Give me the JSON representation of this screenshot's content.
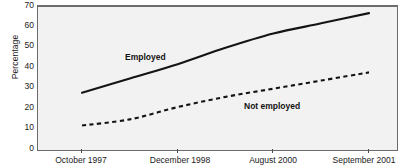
{
  "chart_data": {
    "type": "line",
    "title": "",
    "subtitle": "",
    "xlabel": "",
    "ylabel": "Percentage",
    "xlim": [
      0,
      3
    ],
    "ylim": [
      0,
      70
    ],
    "yticks": [
      0,
      10,
      20,
      30,
      40,
      50,
      60,
      70
    ],
    "grid": false,
    "legend_position": "inline-annotations",
    "categories": [
      "October 1997",
      "December 1998",
      "August 2000",
      "September 2001"
    ],
    "series": [
      {
        "name": "Employed",
        "style": "solid",
        "color": "#141414",
        "values": [
          28,
          42,
          57,
          67
        ],
        "detailed_points": [
          {
            "x": "October 1997",
            "y": 28
          },
          {
            "x": "",
            "y": 35
          },
          {
            "x": "December 1998",
            "y": 42
          },
          {
            "x": "",
            "y": 50
          },
          {
            "x": "August 2000",
            "y": 57
          },
          {
            "x": "",
            "y": 62
          },
          {
            "x": "September 2001",
            "y": 67
          }
        ]
      },
      {
        "name": "Not employed",
        "style": "dashed",
        "color": "#141414",
        "values": [
          12,
          21,
          30,
          38
        ],
        "detailed_points": [
          {
            "x": "October 1997",
            "y": 12
          },
          {
            "x": "",
            "y": 15
          },
          {
            "x": "December 1998",
            "y": 21
          },
          {
            "x": "",
            "y": 26
          },
          {
            "x": "August 2000",
            "y": 30
          },
          {
            "x": "",
            "y": 34
          },
          {
            "x": "September 2001",
            "y": 38
          }
        ]
      }
    ],
    "annotations": [
      {
        "text": "Employed",
        "series": "Employed"
      },
      {
        "text": "Not employed",
        "series": "Not employed"
      }
    ]
  },
  "axes": {
    "y_title": "Percentage",
    "y_tick_labels": [
      "70",
      "60",
      "50",
      "40",
      "30",
      "20",
      "10",
      "0"
    ],
    "x_tick_labels": [
      "October 1997",
      "December 1998",
      "August 2000",
      "September 2001"
    ]
  },
  "annotations": {
    "employed": "Employed",
    "not_employed": "Not employed"
  },
  "colors": {
    "plot_background": "#f2f2f2",
    "frame": "#6b6b6b",
    "line": "#141414",
    "text": "#1a1a1a"
  }
}
